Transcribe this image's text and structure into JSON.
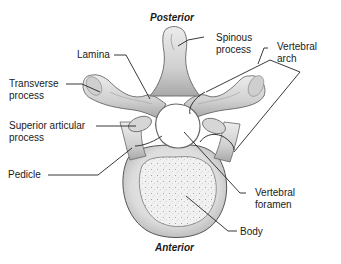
{
  "diagram": {
    "orientation": {
      "top": "Posterior",
      "bottom": "Anterior"
    },
    "labels": {
      "lamina": "Lamina",
      "spinous_process": [
        "Spinous",
        "process"
      ],
      "vertebral_arch": [
        "Vertebral",
        "arch"
      ],
      "transverse_process": [
        "Transverse",
        "process"
      ],
      "superior_articular_process": [
        "Superior articular",
        "process"
      ],
      "pedicle": "Pedicle",
      "vertebral_foramen": [
        "Vertebral",
        "foramen"
      ],
      "body": "Body"
    },
    "colors": {
      "bone_fill": "#e6e6e6",
      "bone_shade": "#b9b9b9",
      "outline": "#555555",
      "leader_line": "#222222",
      "text": "#1a1a1a",
      "background": "#ffffff"
    }
  }
}
